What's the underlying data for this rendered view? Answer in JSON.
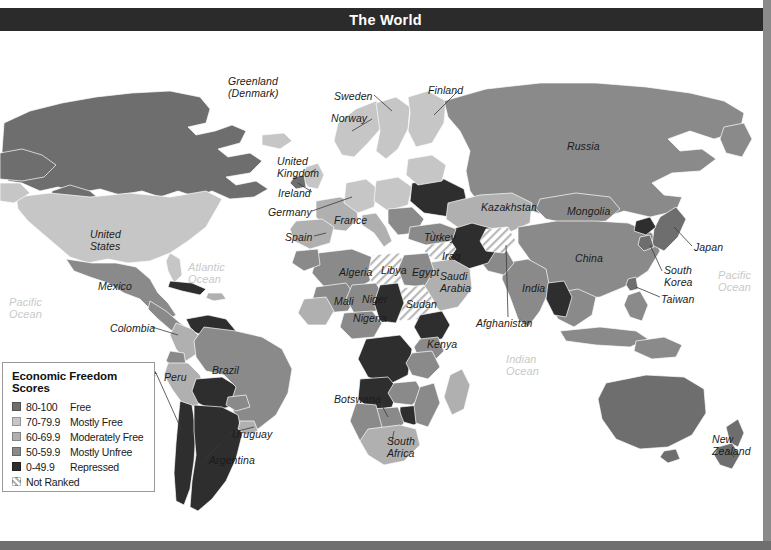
{
  "header": {
    "title": "The World"
  },
  "legend": {
    "title": "Economic Freedom Scores",
    "items": [
      {
        "range": "80-100",
        "label": "Free",
        "color": "#6e6e6e"
      },
      {
        "range": "70-79.9",
        "label": "Mostly Free",
        "color": "#c6c6c6"
      },
      {
        "range": "60-69.9",
        "label": "Moderately Free",
        "color": "#b0b0b0"
      },
      {
        "range": "50-59.9",
        "label": "Mostly Unfree",
        "color": "#8a8a8a"
      },
      {
        "range": "0-49.9",
        "label": "Repressed",
        "color": "#2e2e2e"
      },
      {
        "range": "Not Ranked",
        "label": "",
        "color": "hatch"
      }
    ]
  },
  "map": {
    "country_labels": [
      {
        "name": "greenland",
        "text": "Greenland\n(Denmark)",
        "x": 228,
        "y": 45,
        "align": "left"
      },
      {
        "name": "sweden",
        "text": "Sweden",
        "x": 334,
        "y": 60,
        "align": "left"
      },
      {
        "name": "finland",
        "text": "Finland",
        "x": 428,
        "y": 54,
        "align": "left"
      },
      {
        "name": "norway",
        "text": "Norway",
        "x": 331,
        "y": 82,
        "align": "left"
      },
      {
        "name": "russia",
        "text": "Russia",
        "x": 567,
        "y": 110,
        "align": "left"
      },
      {
        "name": "united-kingdom",
        "text": "United\nKingdom",
        "x": 277,
        "y": 125,
        "align": "left"
      },
      {
        "name": "ireland",
        "text": "Ireland",
        "x": 278,
        "y": 157,
        "align": "left"
      },
      {
        "name": "germany",
        "text": "Germany",
        "x": 268,
        "y": 176,
        "align": "left"
      },
      {
        "name": "france",
        "text": "France",
        "x": 334,
        "y": 184,
        "align": "left"
      },
      {
        "name": "kazakhstan",
        "text": "Kazakhstan",
        "x": 481,
        "y": 171,
        "align": "left"
      },
      {
        "name": "mongolia",
        "text": "Mongolia",
        "x": 567,
        "y": 175,
        "align": "left"
      },
      {
        "name": "spain",
        "text": "Spain",
        "x": 285,
        "y": 201,
        "align": "left"
      },
      {
        "name": "turkey",
        "text": "Turkey",
        "x": 424,
        "y": 201,
        "align": "left"
      },
      {
        "name": "japan",
        "text": "Japan",
        "x": 694,
        "y": 211,
        "align": "left"
      },
      {
        "name": "united-states",
        "text": "United\nStates",
        "x": 90,
        "y": 198,
        "align": "left"
      },
      {
        "name": "china",
        "text": "China",
        "x": 575,
        "y": 222,
        "align": "left"
      },
      {
        "name": "iraq",
        "text": "Iraq",
        "x": 442,
        "y": 220,
        "align": "left"
      },
      {
        "name": "algeria",
        "text": "Algeria",
        "x": 339,
        "y": 236,
        "align": "left"
      },
      {
        "name": "libya",
        "text": "Libya",
        "x": 381,
        "y": 234,
        "align": "left"
      },
      {
        "name": "egypt",
        "text": "Egypt",
        "x": 412,
        "y": 236,
        "align": "left"
      },
      {
        "name": "saudi-arabia",
        "text": "Saudi\nArabia",
        "x": 440,
        "y": 240,
        "align": "left"
      },
      {
        "name": "india",
        "text": "India",
        "x": 522,
        "y": 252,
        "align": "left"
      },
      {
        "name": "south-korea",
        "text": "South\nKorea",
        "x": 664,
        "y": 234,
        "align": "left"
      },
      {
        "name": "mexico",
        "text": "Mexico",
        "x": 98,
        "y": 250,
        "align": "left"
      },
      {
        "name": "mali",
        "text": "Mali",
        "x": 334,
        "y": 265,
        "align": "left"
      },
      {
        "name": "niger",
        "text": "Niger",
        "x": 362,
        "y": 263,
        "align": "left"
      },
      {
        "name": "sudan",
        "text": "Sudan",
        "x": 406,
        "y": 268,
        "align": "left"
      },
      {
        "name": "taiwan",
        "text": "Taiwan",
        "x": 661,
        "y": 263,
        "align": "left"
      },
      {
        "name": "nigeria",
        "text": "Nigeria",
        "x": 353,
        "y": 282,
        "align": "left"
      },
      {
        "name": "afghanistan",
        "text": "Afghanistan",
        "x": 476,
        "y": 287,
        "align": "left"
      },
      {
        "name": "colombia",
        "text": "Colombia",
        "x": 110,
        "y": 292,
        "align": "left"
      },
      {
        "name": "kenya",
        "text": "Kenya",
        "x": 427,
        "y": 308,
        "align": "left"
      },
      {
        "name": "chile",
        "text": "Chile",
        "x": 132,
        "y": 337,
        "align": "left"
      },
      {
        "name": "peru",
        "text": "Peru",
        "x": 164,
        "y": 341,
        "align": "left"
      },
      {
        "name": "brazil",
        "text": "Brazil",
        "x": 212,
        "y": 334,
        "align": "left"
      },
      {
        "name": "botswana",
        "text": "Botswana",
        "x": 334,
        "y": 363,
        "align": "left"
      },
      {
        "name": "uruguay",
        "text": "Uruguay",
        "x": 232,
        "y": 398,
        "align": "left"
      },
      {
        "name": "new-zealand",
        "text": "New\nZealand",
        "x": 712,
        "y": 403,
        "align": "left"
      },
      {
        "name": "south-africa",
        "text": "South\nAfrica",
        "x": 387,
        "y": 405,
        "align": "left"
      },
      {
        "name": "argentina",
        "text": "Argentina",
        "x": 209,
        "y": 424,
        "align": "left"
      }
    ],
    "ocean_labels": [
      {
        "name": "atlantic-ocean",
        "text": "Atlantic\nOcean",
        "x": 188,
        "y": 231
      },
      {
        "name": "pacific-ocean-west",
        "text": "Pacific\nOcean",
        "x": 9,
        "y": 266
      },
      {
        "name": "pacific-ocean-east",
        "text": "Pacific\nOcean",
        "x": 718,
        "y": 239
      },
      {
        "name": "indian-ocean",
        "text": "Indian\nOcean",
        "x": 506,
        "y": 323
      }
    ]
  },
  "chart_data": {
    "type": "map",
    "title": "The World",
    "value_label": "Economic Freedom Scores",
    "bins": [
      {
        "range": "80-100",
        "label": "Free",
        "color": "#6e6e6e"
      },
      {
        "range": "70-79.9",
        "label": "Mostly Free",
        "color": "#c6c6c6"
      },
      {
        "range": "60-69.9",
        "label": "Moderately Free",
        "color": "#b0b0b0"
      },
      {
        "range": "50-59.9",
        "label": "Mostly Unfree",
        "color": "#8a8a8a"
      },
      {
        "range": "0-49.9",
        "label": "Repressed",
        "color": "#2e2e2e"
      },
      {
        "range": "Not Ranked",
        "label": "Not Ranked",
        "color": "hatch"
      }
    ],
    "country_categories": [
      {
        "country": "United States",
        "category": "Mostly Free"
      },
      {
        "country": "Canada",
        "category": "Free"
      },
      {
        "country": "Mexico",
        "category": "Mostly Unfree"
      },
      {
        "country": "Greenland (Denmark)",
        "category": "Mostly Unfree"
      },
      {
        "country": "Colombia",
        "category": "Moderately Free"
      },
      {
        "country": "Venezuela",
        "category": "Repressed"
      },
      {
        "country": "Brazil",
        "category": "Mostly Unfree"
      },
      {
        "country": "Peru",
        "category": "Moderately Free"
      },
      {
        "country": "Chile",
        "category": "Free"
      },
      {
        "country": "Argentina",
        "category": "Repressed"
      },
      {
        "country": "Uruguay",
        "category": "Moderately Free"
      },
      {
        "country": "Bolivia",
        "category": "Repressed"
      },
      {
        "country": "United Kingdom",
        "category": "Mostly Free"
      },
      {
        "country": "Ireland",
        "category": "Free"
      },
      {
        "country": "Germany",
        "category": "Mostly Free"
      },
      {
        "country": "France",
        "category": "Moderately Free"
      },
      {
        "country": "Spain",
        "category": "Moderately Free"
      },
      {
        "country": "Sweden",
        "category": "Mostly Free"
      },
      {
        "country": "Norway",
        "category": "Mostly Free"
      },
      {
        "country": "Finland",
        "category": "Mostly Free"
      },
      {
        "country": "Ukraine",
        "category": "Repressed"
      },
      {
        "country": "Russia",
        "category": "Mostly Unfree"
      },
      {
        "country": "Turkey",
        "category": "Mostly Unfree"
      },
      {
        "country": "Kazakhstan",
        "category": "Moderately Free"
      },
      {
        "country": "Mongolia",
        "category": "Mostly Unfree"
      },
      {
        "country": "China",
        "category": "Mostly Unfree"
      },
      {
        "country": "India",
        "category": "Mostly Unfree"
      },
      {
        "country": "Japan",
        "category": "Free"
      },
      {
        "country": "South Korea",
        "category": "Free"
      },
      {
        "country": "Taiwan",
        "category": "Free"
      },
      {
        "country": "Iran",
        "category": "Repressed"
      },
      {
        "country": "Iraq",
        "category": "Not Ranked"
      },
      {
        "country": "Afghanistan",
        "category": "Not Ranked"
      },
      {
        "country": "Saudi Arabia",
        "category": "Moderately Free"
      },
      {
        "country": "Egypt",
        "category": "Mostly Unfree"
      },
      {
        "country": "Libya",
        "category": "Not Ranked"
      },
      {
        "country": "Sudan",
        "category": "Not Ranked"
      },
      {
        "country": "Algeria",
        "category": "Mostly Unfree"
      },
      {
        "country": "Mali",
        "category": "Mostly Unfree"
      },
      {
        "country": "Niger",
        "category": "Mostly Unfree"
      },
      {
        "country": "Nigeria",
        "category": "Mostly Unfree"
      },
      {
        "country": "Kenya",
        "category": "Mostly Unfree"
      },
      {
        "country": "Botswana",
        "category": "Mostly Free"
      },
      {
        "country": "South Africa",
        "category": "Moderately Free"
      },
      {
        "country": "Australia",
        "category": "Free"
      },
      {
        "country": "New Zealand",
        "category": "Free"
      }
    ]
  }
}
